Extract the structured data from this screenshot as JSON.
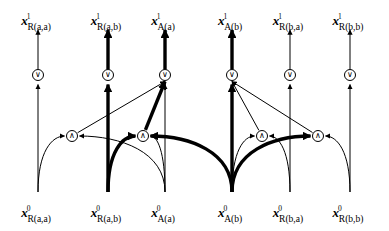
{
  "figure": {
    "background_color": "#ffffff",
    "stroke_color": "#000000",
    "bold_stroke_color": "#000000",
    "thin_width": 1.0,
    "bold_width": 3.4,
    "width": 389,
    "height": 231
  },
  "glyphs": {
    "or": "∨",
    "and": "∧"
  },
  "columns": [
    {
      "id": "col-r-aa",
      "x": 38,
      "emphasis": "thin",
      "top": {
        "symbol": "x",
        "superscript": "1",
        "subscript": "R(a,a)",
        "text": "x1R(a,a)"
      },
      "bottom": {
        "symbol": "x",
        "superscript": "0",
        "subscript": "R(a,a)",
        "text": "x0R(a,a)"
      }
    },
    {
      "id": "col-r-ab",
      "x": 108,
      "emphasis": "bold",
      "top": {
        "symbol": "x",
        "superscript": "1",
        "subscript": "R(a,b)",
        "text": "x1R(a,b)"
      },
      "bottom": {
        "symbol": "x",
        "superscript": "0",
        "subscript": "R(a,b)",
        "text": "x0R(a,b)"
      }
    },
    {
      "id": "col-a-a",
      "x": 165,
      "emphasis": "bold",
      "top": {
        "symbol": "x",
        "superscript": "1",
        "subscript": "A(a)",
        "text": "x1A(a)"
      },
      "bottom": {
        "symbol": "x",
        "superscript": "0",
        "subscript": "A(a)",
        "text": "x0A(a)"
      }
    },
    {
      "id": "col-a-b",
      "x": 232,
      "emphasis": "bold",
      "top": {
        "symbol": "x",
        "superscript": "1",
        "subscript": "A(b)",
        "text": "x1A(b)"
      },
      "bottom": {
        "symbol": "x",
        "superscript": "0",
        "subscript": "A(b)",
        "text": "x0A(b)"
      }
    },
    {
      "id": "col-r-ba",
      "x": 290,
      "emphasis": "thin",
      "top": {
        "symbol": "x",
        "superscript": "1",
        "subscript": "R(b,a)",
        "text": "x1R(b,a)"
      },
      "bottom": {
        "symbol": "x",
        "superscript": "0",
        "subscript": "R(b,a)",
        "text": "x0R(b,a)"
      }
    },
    {
      "id": "col-r-bb",
      "x": 350,
      "emphasis": "thin",
      "top": {
        "symbol": "x",
        "superscript": "1",
        "subscript": "R(b,b)",
        "text": "x1R(b,b)"
      },
      "bottom": {
        "symbol": "x",
        "superscript": "0",
        "subscript": "R(b,b)",
        "text": "x0R(b,b)"
      }
    }
  ],
  "or_nodes": [
    {
      "id": "or-r-aa",
      "x": 38,
      "y": 75,
      "glyph": "∨",
      "emphasis": "thin"
    },
    {
      "id": "or-r-ab",
      "x": 108,
      "y": 75,
      "glyph": "∨",
      "emphasis": "bold"
    },
    {
      "id": "or-a-a",
      "x": 165,
      "y": 75,
      "glyph": "∨",
      "emphasis": "bold"
    },
    {
      "id": "or-a-b",
      "x": 232,
      "y": 75,
      "glyph": "∨",
      "emphasis": "bold"
    },
    {
      "id": "or-r-ba",
      "x": 290,
      "y": 75,
      "glyph": "∨",
      "emphasis": "thin"
    },
    {
      "id": "or-r-bb",
      "x": 350,
      "y": 75,
      "glyph": "∨",
      "emphasis": "thin"
    }
  ],
  "and_nodes": [
    {
      "id": "and-1",
      "x": 72,
      "y": 136,
      "glyph": "∧",
      "emphasis": "thin"
    },
    {
      "id": "and-2",
      "x": 143,
      "y": 136,
      "glyph": "∧",
      "emphasis": "bold"
    },
    {
      "id": "and-3",
      "x": 262,
      "y": 136,
      "glyph": "∧",
      "emphasis": "thin"
    },
    {
      "id": "and-4",
      "x": 318,
      "y": 136,
      "glyph": "∧",
      "emphasis": "bold"
    }
  ],
  "geometry": {
    "label_top_y": 14,
    "label_bottom_y": 206,
    "arrow_top_y": 30,
    "column_bottom_y": 192,
    "or_node_radius": 5.5,
    "and_node_radius": 5.5
  },
  "edges": {
    "column_upper_segments": [
      {
        "id": "seg-up-r-aa",
        "column": "col-r-aa",
        "emphasis": "thin"
      },
      {
        "id": "seg-up-r-ab",
        "column": "col-r-ab",
        "emphasis": "bold"
      },
      {
        "id": "seg-up-a-a",
        "column": "col-a-a",
        "emphasis": "bold"
      },
      {
        "id": "seg-up-a-b",
        "column": "col-a-b",
        "emphasis": "bold"
      },
      {
        "id": "seg-up-r-ba",
        "column": "col-r-ba",
        "emphasis": "thin"
      },
      {
        "id": "seg-up-r-bb",
        "column": "col-r-bb",
        "emphasis": "thin"
      }
    ],
    "column_lower_segments": [
      {
        "id": "seg-dn-r-aa",
        "column": "col-r-aa",
        "emphasis": "thin"
      },
      {
        "id": "seg-dn-r-ab",
        "column": "col-r-ab",
        "emphasis": "bold"
      },
      {
        "id": "seg-dn-a-a",
        "column": "col-a-a",
        "emphasis": "thin"
      },
      {
        "id": "seg-dn-a-b",
        "column": "col-a-b",
        "emphasis": "bold"
      },
      {
        "id": "seg-dn-r-ba",
        "column": "col-r-ba",
        "emphasis": "thin"
      },
      {
        "id": "seg-dn-r-bb",
        "column": "col-r-bb",
        "emphasis": "thin"
      }
    ],
    "diagonals": [
      {
        "id": "diag-and1-to-or-a-a",
        "from": "and-1",
        "to": "or-a-a",
        "emphasis": "thin"
      },
      {
        "id": "diag-and2-to-or-a-a",
        "from": "and-2",
        "to": "or-a-a",
        "emphasis": "bold"
      },
      {
        "id": "diag-and3-to-or-a-b",
        "from": "and-3",
        "to": "or-a-b",
        "emphasis": "thin"
      },
      {
        "id": "diag-and4-to-or-a-b",
        "from": "and-4",
        "to": "or-a-b",
        "emphasis": "thin"
      }
    ],
    "curves": [
      {
        "id": "curve-r-aa-to-and1",
        "from": "col-r-aa",
        "to": "and-1",
        "emphasis": "thin"
      },
      {
        "id": "curve-a-a-to-and1",
        "from": "col-a-a",
        "to": "and-1",
        "emphasis": "thin"
      },
      {
        "id": "curve-r-ab-to-and2",
        "from": "col-r-ab",
        "to": "and-2",
        "emphasis": "bold"
      },
      {
        "id": "curve-a-b-to-and2",
        "from": "col-a-b",
        "to": "and-2",
        "emphasis": "bold"
      },
      {
        "id": "curve-a-a-to-and2",
        "from": "col-a-a",
        "to": "and-2",
        "emphasis": "thin"
      },
      {
        "id": "curve-a-b-to-and3",
        "from": "col-a-b",
        "to": "and-3",
        "emphasis": "thin"
      },
      {
        "id": "curve-r-ba-to-and3",
        "from": "col-r-ba",
        "to": "and-3",
        "emphasis": "thin"
      },
      {
        "id": "curve-a-b-to-and4",
        "from": "col-a-b",
        "to": "and-4",
        "emphasis": "bold"
      },
      {
        "id": "curve-r-bb-to-and4",
        "from": "col-r-bb",
        "to": "and-4",
        "emphasis": "thin"
      }
    ]
  }
}
